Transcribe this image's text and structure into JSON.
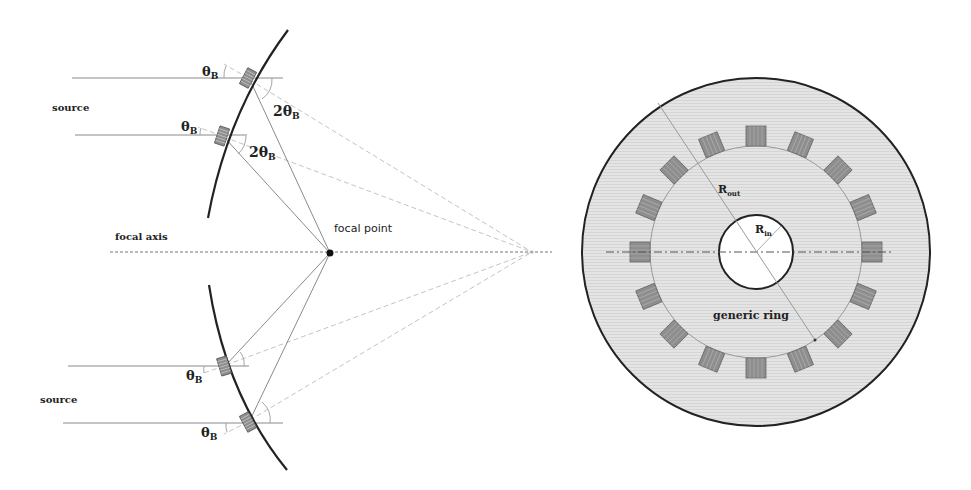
{
  "left_figure": {
    "labels": {
      "source_top": "source",
      "source_bottom": "source",
      "focal_axis": "focal axis",
      "focal_point": "focal point",
      "theta_b_symbol": "θ",
      "theta_b_subscript": "B",
      "two_theta_b_prefix": "2θ",
      "two_theta_b_subscript": "B"
    },
    "focal_point": {
      "x": 330,
      "y": 253
    },
    "far_point": {
      "x": 532,
      "y": 252
    },
    "crystals_count": 4
  },
  "right_figure": {
    "labels": {
      "r_out": "R",
      "r_out_subscript": "out",
      "r_in": "R",
      "r_in_subscript": "in",
      "ring_label": "generic ring"
    },
    "center": {
      "x": 756,
      "y": 252
    },
    "outer_radius": 174,
    "crystal_circle_radius": 106,
    "inner_radius": 37,
    "crystals_count": 16,
    "colors": {
      "ring_fill": "#e6e6e6",
      "crystal_fill": "#8e8e8e",
      "outline": "#222222"
    }
  }
}
